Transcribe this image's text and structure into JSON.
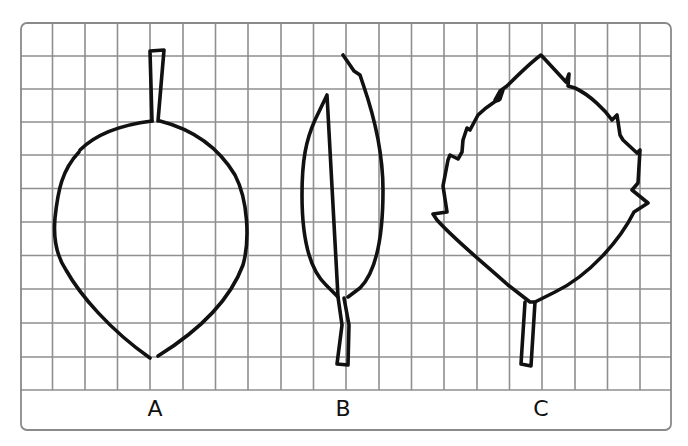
{
  "diagram": {
    "type": "leaf-comparison-on-grid",
    "grid": {
      "color": "#8a8a8a",
      "frame_color": "#8a8a8a",
      "columns": 20,
      "rows": 11
    },
    "outline_color": "#111111",
    "leaves": [
      {
        "id": "A",
        "label": "A",
        "shape": "ovate, smooth margin, stem on top"
      },
      {
        "id": "B",
        "label": "B",
        "shape": "lanceolate, smooth margin, stem at bottom"
      },
      {
        "id": "C",
        "label": "C",
        "shape": "ovate, serrated margin, stem at bottom"
      }
    ]
  }
}
